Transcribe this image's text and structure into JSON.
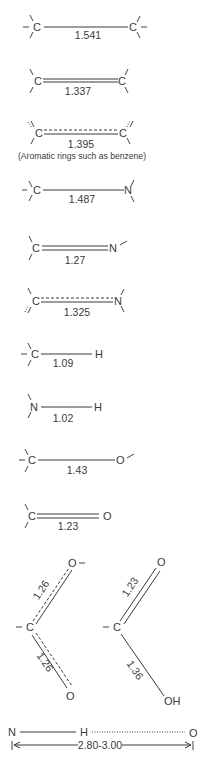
{
  "bonds": [
    {
      "left": "C",
      "right": "C",
      "type": "single",
      "length": "1.541"
    },
    {
      "left": "C",
      "right": "C",
      "type": "double",
      "length": "1.337"
    },
    {
      "left": "C",
      "right": "C",
      "type": "aromatic",
      "length": "1.395",
      "note": "(Aromatic rings such as benzene)"
    },
    {
      "left": "C",
      "right": "N",
      "type": "single",
      "length": "1.487"
    },
    {
      "left": "C",
      "right": "N",
      "type": "double",
      "length": "1.27"
    },
    {
      "left": "C",
      "right": "N",
      "type": "partial-double",
      "length": "1.325"
    },
    {
      "left": "C",
      "right": "H",
      "type": "single",
      "length": "1.09"
    },
    {
      "left": "N",
      "right": "H",
      "type": "single",
      "length": "1.02"
    },
    {
      "left": "C",
      "right": "O",
      "type": "single",
      "length": "1.43"
    },
    {
      "left": "C",
      "right": "O",
      "type": "double",
      "length": "1.23"
    }
  ],
  "carboxylate": {
    "center": "C",
    "top": "O",
    "bottom": "O",
    "top_length": "1.26",
    "bottom_length": "1.26"
  },
  "carboxylic_acid": {
    "center": "C",
    "top": "O",
    "bottom": "OH",
    "top_length": "1.23",
    "bottom_length": "1.36"
  },
  "hydrogen_bond": {
    "donor": "N",
    "hydrogen": "H",
    "acceptor": "O",
    "distance": "2.80-3.00"
  }
}
